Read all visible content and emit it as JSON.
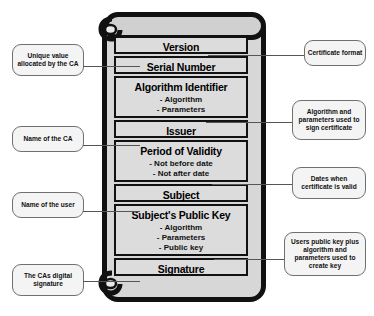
{
  "diagram": {
    "scroll": {
      "icon": "scroll-icon",
      "fill_color": "#d7d7d7",
      "border_color": "#111111"
    },
    "fields": [
      {
        "id": "version",
        "label": "Version",
        "sub": []
      },
      {
        "id": "serial",
        "label": "Serial Number",
        "sub": []
      },
      {
        "id": "algid",
        "label": "Algorithm Identifier",
        "sub": [
          "- Algorithm",
          "- Parameters"
        ]
      },
      {
        "id": "issuer",
        "label": "Issuer",
        "sub": []
      },
      {
        "id": "validity",
        "label": "Period of Validity",
        "sub": [
          "- Not before date",
          "- Not after date"
        ]
      },
      {
        "id": "subject",
        "label": "Subject",
        "sub": []
      },
      {
        "id": "pubkey",
        "label": "Subject's Public Key",
        "sub": [
          "- Algorithm",
          "- Parameters",
          "- Public key"
        ]
      },
      {
        "id": "signature",
        "label": "Signature",
        "sub": []
      }
    ],
    "callouts_left": [
      {
        "id": "serial-note",
        "text": "Unique value allocated by the CA",
        "target": "serial"
      },
      {
        "id": "issuer-note",
        "text": "Name of the CA",
        "target": "issuer"
      },
      {
        "id": "subject-note",
        "text": "Name of the user",
        "target": "subject"
      },
      {
        "id": "signature-note",
        "text": "The CAs digital signature",
        "target": "signature"
      }
    ],
    "callouts_right": [
      {
        "id": "version-note",
        "text": "Certificate format",
        "target": "version"
      },
      {
        "id": "algid-note",
        "text": "Algorithm and parameters used to sign certificate",
        "target": "algid"
      },
      {
        "id": "validity-note",
        "text": "Dates when certificate is valid",
        "target": "validity"
      },
      {
        "id": "pubkey-note",
        "text": "Users public key plus algorithm and parameters used to create key",
        "target": "pubkey"
      }
    ]
  }
}
